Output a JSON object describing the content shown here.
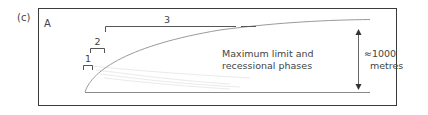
{
  "figure": {
    "panel_label": "(c)",
    "corner_label": "A",
    "phase_labels": [
      "1",
      "2",
      "3"
    ],
    "annotation": {
      "line1": "Maximum limit and",
      "line2": "recessional phases"
    },
    "scale": {
      "value": "≈1000",
      "unit": "metres"
    },
    "colors": {
      "frame": "#3a3a3a",
      "curve": "#9a9a9a",
      "faint_lines": "#e2e2e2",
      "bracket": "#555555"
    }
  }
}
